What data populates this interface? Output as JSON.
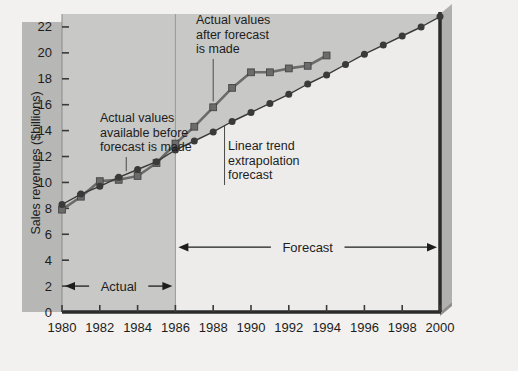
{
  "chart_data": {
    "type": "line",
    "title": "",
    "xlabel": "",
    "ylabel": "Sales revenues ($billions)",
    "xlim": [
      1980,
      2000
    ],
    "ylim": [
      0,
      23
    ],
    "xticks": [
      1980,
      1982,
      1984,
      1986,
      1988,
      1990,
      1992,
      1994,
      1996,
      1998,
      2000
    ],
    "xtick_labels": [
      "1980",
      "1982",
      "1984",
      "1986",
      "1988",
      "1990",
      "1992",
      "1994",
      "1996",
      "1998",
      "2000"
    ],
    "yticks": [
      0,
      2,
      4,
      6,
      8,
      10,
      12,
      14,
      16,
      18,
      20,
      22
    ],
    "ytick_labels": [
      "0",
      "2",
      "4",
      "6",
      "8",
      "10",
      "12",
      "14",
      "16",
      "18",
      "20",
      "22"
    ],
    "grid": false,
    "legend_position": "none",
    "forecast_origin": 1986,
    "x": [
      1980,
      1981,
      1982,
      1983,
      1984,
      1985,
      1986,
      1987,
      1988,
      1989,
      1990,
      1991,
      1992,
      1993,
      1994,
      1995,
      1996,
      1997,
      1998,
      1999,
      2000
    ],
    "series": [
      {
        "name": "Actual values",
        "marker": "square",
        "color": "#6b6b6b",
        "values": [
          7.9,
          8.9,
          10.1,
          10.2,
          10.5,
          11.5,
          13.0,
          14.3,
          15.8,
          17.3,
          18.5,
          18.5,
          18.8,
          19.0,
          19.8,
          null,
          null,
          null,
          null,
          null,
          null
        ]
      },
      {
        "name": "Linear trend extrapolation forecast",
        "marker": "circle",
        "color": "#3a3a3a",
        "values": [
          8.3,
          9.1,
          9.7,
          10.4,
          11.0,
          11.6,
          12.5,
          13.2,
          13.9,
          14.7,
          15.4,
          16.1,
          16.8,
          17.6,
          18.3,
          19.1,
          19.9,
          20.6,
          21.3,
          22.0,
          22.8
        ]
      }
    ],
    "annotations": [
      {
        "name": "actual-values-before-forecast",
        "text": "Actual values available before forecast is made",
        "lines": [
          "Actual values",
          "available before",
          "forecast is made"
        ],
        "leader_to_x": 1983.4,
        "leader_to_y": 10.4
      },
      {
        "name": "actual-values-after-forecast",
        "text": "Actual values after forecast is made",
        "lines": [
          "Actual values",
          "after forecast",
          "is made"
        ],
        "leader_to_x": 1988.0,
        "leader_to_y": 15.8
      },
      {
        "name": "linear-trend-extrapolation-forecast",
        "text": "Linear trend extrapolation forecast",
        "lines": [
          "Linear trend",
          "extrapolation",
          "forecast"
        ],
        "leader_to_x": 1988.6,
        "leader_to_y": 13.9
      }
    ],
    "range_markers": [
      {
        "name": "actual-range",
        "label": "Actual",
        "from_x": 1980,
        "to_x": 1986,
        "at_y": 2.0,
        "arrows": "both"
      },
      {
        "name": "forecast-range",
        "label": "Forecast",
        "from_x": 1986,
        "to_x": 2000,
        "at_y": 5.0,
        "arrows": "both"
      }
    ],
    "colors": {
      "page_background": "#f2f1ef",
      "plot_background": "#c8c8c6",
      "axis_label_band": "#b7b7b5",
      "forecast_region": "#edecea",
      "axis_line": "#2b2b2b",
      "actual_series": "#6b6b6b",
      "trend_series": "#3a3a3a",
      "text": "#1d1d1d"
    }
  }
}
